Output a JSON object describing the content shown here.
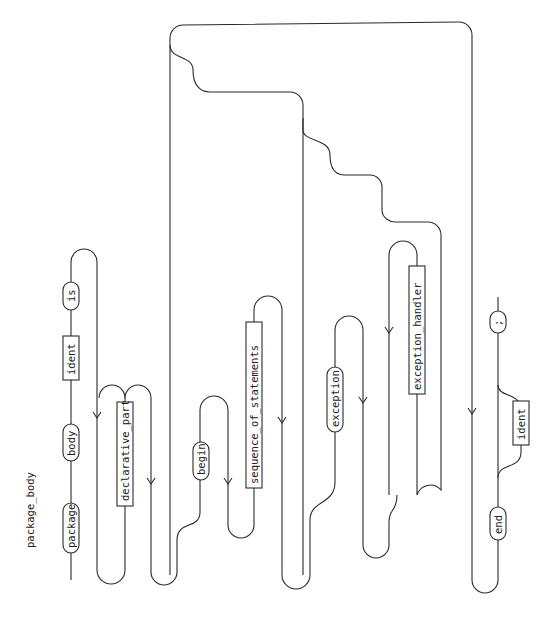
{
  "diagram": {
    "title": "package_body",
    "orientation": "rotated 90° clockwise (reads bottom-to-top)",
    "line_color": "#2a2a2a",
    "background": "#ffffff",
    "terminals": {
      "package": "package",
      "body": "body",
      "is": "is",
      "begin": "begin",
      "exception": "exception",
      "end": "end",
      "semicolon": ";"
    },
    "nonterminals": {
      "ident1": "ident",
      "declarative_part": "declarative_part",
      "sequence_of_statements": "sequence_of_statements",
      "exception_handler": "exception_handler",
      "ident2": "ident"
    }
  }
}
